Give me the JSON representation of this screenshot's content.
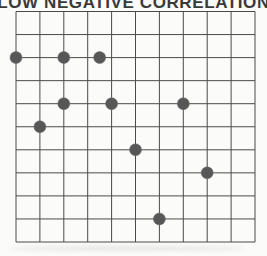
{
  "chart_data": {
    "type": "scatter",
    "title": "LOW NEGATIVE CORRELATION",
    "xlabel": "",
    "ylabel": "",
    "xlim": [
      0,
      10
    ],
    "ylim": [
      0,
      10
    ],
    "grid": "on",
    "grid_cols": 10,
    "grid_rows": 10,
    "axis_tick_labels": "none",
    "legend": "none",
    "points": [
      {
        "x": 0,
        "y": 8
      },
      {
        "x": 2,
        "y": 8
      },
      {
        "x": 3.5,
        "y": 8
      },
      {
        "x": 2,
        "y": 6
      },
      {
        "x": 4,
        "y": 6
      },
      {
        "x": 7,
        "y": 6
      },
      {
        "x": 1,
        "y": 5
      },
      {
        "x": 5,
        "y": 4
      },
      {
        "x": 8,
        "y": 3
      },
      {
        "x": 6,
        "y": 1
      }
    ],
    "point_radius_px": 6,
    "colors": {
      "point": "#575757",
      "point_edge": "#6e6e6e",
      "grid_line": "#4b4b4b",
      "title": "#3a3a3a",
      "background": "#fbfbf9"
    }
  }
}
